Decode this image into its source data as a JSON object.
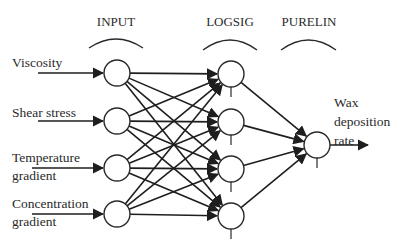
{
  "diagram": {
    "colors": {
      "line": "#1e1e1e",
      "text": "#2a2a2a",
      "background": "#ffffff"
    },
    "layers": [
      {
        "id": "input",
        "label": "INPUT",
        "label_x": 116,
        "label_y": 26,
        "arc": [
          89,
          143,
          48,
          40
        ],
        "node_x": 117,
        "activation": "none"
      },
      {
        "id": "hidden",
        "label": "LOGSIG",
        "label_x": 230,
        "label_y": 26,
        "arc": [
          203,
          257,
          50,
          40
        ],
        "node_x": 231,
        "activation": "logsig"
      },
      {
        "id": "output",
        "label": "PURELIN",
        "label_x": 309,
        "label_y": 26,
        "arc": [
          281,
          336,
          50,
          40
        ],
        "node_x": 317,
        "activation": "purelin"
      }
    ],
    "node_radius": 13,
    "input_nodes": [
      {
        "label_lines": [
          "Viscosity"
        ],
        "y": 73,
        "label_x": 12,
        "label_y": [
          67
        ],
        "arrow_from": 38
      },
      {
        "label_lines": [
          "Shear stress"
        ],
        "y": 121,
        "label_x": 12,
        "label_y": [
          117
        ],
        "arrow_from": 38
      },
      {
        "label_lines": [
          "Temperature",
          "gradient"
        ],
        "y": 168,
        "label_x": 12,
        "label_y": [
          162,
          180
        ],
        "arrow_from": 32
      },
      {
        "label_lines": [
          "Concentration",
          "gradient"
        ],
        "y": 214,
        "label_x": 12,
        "label_y": [
          208,
          226
        ],
        "arrow_from": 32
      }
    ],
    "hidden_nodes": [
      {
        "y": 74
      },
      {
        "y": 122
      },
      {
        "y": 169
      },
      {
        "y": 216
      }
    ],
    "output_node": {
      "y": 145,
      "label_lines": [
        "Wax",
        "deposition",
        "rate"
      ],
      "label_x": 334,
      "label_y": [
        107,
        126,
        145
      ],
      "arrow_to": 368
    }
  }
}
